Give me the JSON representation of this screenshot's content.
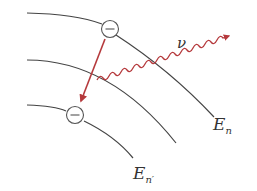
{
  "diagram": {
    "type": "energy-level-transition",
    "levels": [
      {
        "id": "upper",
        "label_main": "E",
        "label_sub": "n",
        "has_electron": true
      },
      {
        "id": "middle",
        "label_main": "",
        "label_sub": "",
        "has_electron": false
      },
      {
        "id": "lower",
        "label_main": "E",
        "label_sub": "n′",
        "has_electron": true
      }
    ],
    "electron_symbol": "−",
    "photon": {
      "label": "ν"
    },
    "colors": {
      "curve": "#444444",
      "arrow": "#b5393c",
      "photon": "#b5393c",
      "electron_stroke": "#555555",
      "text": "#333333"
    }
  }
}
